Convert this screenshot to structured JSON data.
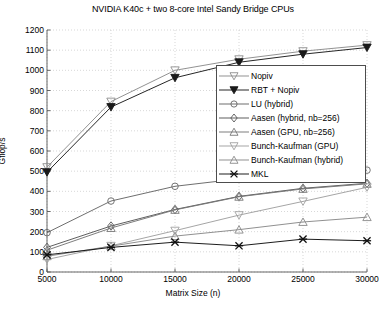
{
  "chart_data": {
    "type": "line",
    "title": "NVIDIA K40c + two 8-core Intel Sandy Bridge CPUs",
    "xlabel": "Matrix Size (n)",
    "ylabel": "Gflop/s",
    "x": [
      5000,
      10000,
      15000,
      20000,
      25000,
      30000
    ],
    "xticks": [
      "5000",
      "10000",
      "15000",
      "20000",
      "25000",
      "30000"
    ],
    "yticks": [
      "0",
      "100",
      "200",
      "300",
      "400",
      "500",
      "600",
      "700",
      "800",
      "900",
      "1000",
      "1100",
      "1200"
    ],
    "xlim": [
      5000,
      30000
    ],
    "ylim": [
      0,
      1200
    ],
    "grid": true,
    "legend_position": "center-right",
    "series": [
      {
        "name": "Nopiv",
        "marker": "triangle-down-open",
        "color": "#8c8c8c",
        "values": [
          520,
          845,
          1000,
          1055,
          1095,
          1125
        ]
      },
      {
        "name": "RBT + Nopiv",
        "marker": "triangle-down-filled",
        "color": "#1a1a1a",
        "values": [
          495,
          818,
          963,
          1040,
          1080,
          1113
        ]
      },
      {
        "name": "LU (hybrid)",
        "marker": "circle-open",
        "color": "#666666",
        "values": [
          195,
          352,
          425,
          462,
          487,
          505
        ]
      },
      {
        "name": "Aasen (hybrid, nb=256)",
        "marker": "diamond-open",
        "color": "#555555",
        "values": [
          122,
          228,
          310,
          375,
          415,
          440
        ]
      },
      {
        "name": "Aasen (GPU, nb=256)",
        "marker": "triangle-up-open",
        "color": "#777777",
        "values": [
          108,
          218,
          308,
          373,
          412,
          437
        ]
      },
      {
        "name": "Bunch-Kaufman (GPU)",
        "marker": "triangle-down-open",
        "color": "#a0a0a0",
        "values": [
          62,
          130,
          205,
          282,
          350,
          420
        ]
      },
      {
        "name": "Bunch-Kaufman (hybrid)",
        "marker": "triangle-up-open",
        "color": "#8a8a8a",
        "values": [
          78,
          128,
          178,
          210,
          248,
          272
        ]
      },
      {
        "name": "MKL",
        "marker": "x-filled",
        "color": "#111111",
        "values": [
          85,
          122,
          148,
          130,
          163,
          155
        ]
      }
    ]
  },
  "legend": {
    "items": [
      {
        "label": "Nopiv"
      },
      {
        "label": "RBT + Nopiv"
      },
      {
        "label": "LU (hybrid)"
      },
      {
        "label": "Aasen (hybrid, nb=256)"
      },
      {
        "label": "Aasen (GPU, nb=256)"
      },
      {
        "label": "Bunch-Kaufman (GPU)"
      },
      {
        "label": "Bunch-Kaufman (hybrid)"
      },
      {
        "label": "MKL"
      }
    ]
  }
}
